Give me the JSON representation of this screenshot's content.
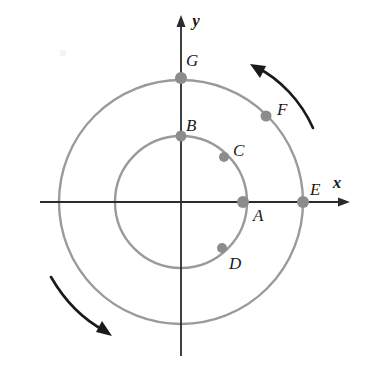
{
  "figure": {
    "background_color": "#ffffff",
    "axis_color": "#2b2b2b",
    "circle_color": "#9a9a9a",
    "point_color": "#8c8c8c",
    "arrow_color": "#1a1a1a",
    "label_color": "#1a1a1a"
  },
  "axes": {
    "origin": {
      "x": 181,
      "y": 202
    },
    "x_label": "x",
    "y_label": "y",
    "x_label_pos": {
      "x": 337,
      "y": 188
    },
    "y_label_pos": {
      "x": 196,
      "y": 26
    },
    "x_start": {
      "x": 40,
      "y": 202
    },
    "x_end": {
      "x": 349,
      "y": 202
    },
    "y_start": {
      "x": 181,
      "y": 356
    },
    "y_end": {
      "x": 181,
      "y": 16
    }
  },
  "circles": [
    {
      "name": "inner-circle",
      "cx": 181,
      "cy": 202,
      "r": 66
    },
    {
      "name": "outer-circle",
      "cx": 181,
      "cy": 202,
      "r": 122
    }
  ],
  "points": [
    {
      "id": "A",
      "label": "A",
      "cx": 243,
      "cy": 202,
      "r": 6.0,
      "circle": "inner",
      "angle_deg": 0,
      "label_x": 253,
      "label_y": 221
    },
    {
      "id": "B",
      "label": "B",
      "cx": 181,
      "cy": 136,
      "r": 5.5,
      "circle": "inner",
      "angle_deg": 90,
      "label_x": 186,
      "label_y": 131
    },
    {
      "id": "C",
      "label": "C",
      "cx": 224,
      "cy": 157,
      "r": 5.0,
      "circle": "inner",
      "angle_deg": 47,
      "label_x": 233,
      "label_y": 155
    },
    {
      "id": "D",
      "label": "D",
      "cx": 222,
      "cy": 248,
      "r": 5.0,
      "circle": "inner",
      "angle_deg": -45,
      "label_x": 229,
      "label_y": 268
    },
    {
      "id": "E",
      "label": "E",
      "cx": 303,
      "cy": 202,
      "r": 6.0,
      "circle": "outer",
      "angle_deg": 0,
      "label_x": 310,
      "label_y": 194
    },
    {
      "id": "F",
      "label": "F",
      "cx": 266,
      "cy": 116,
      "r": 5.5,
      "circle": "outer",
      "angle_deg": 46,
      "label_x": 277,
      "label_y": 114
    },
    {
      "id": "G",
      "label": "G",
      "cx": 181,
      "cy": 78,
      "r": 6.0,
      "circle": "outer",
      "angle_deg": 90,
      "label_x": 186,
      "label_y": 65
    }
  ],
  "rotation_arrows": [
    {
      "name": "top-right-rotation-arrow",
      "direction": "counterclockwise",
      "path": "M 313,128 C 300,100 280,78 255,66",
      "head": "M 255,66 L 268,70 L 261,80 Z"
    },
    {
      "name": "bottom-left-rotation-arrow",
      "direction": "clockwise",
      "path": "M 51,277 C 66,302 86,320 108,333",
      "head": "M 110,334 L 97,331 L 104,321 Z"
    }
  ]
}
